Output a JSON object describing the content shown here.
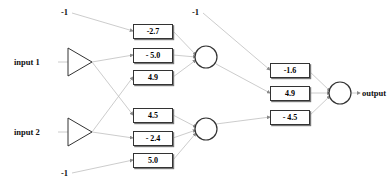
{
  "diagram": {
    "background_color": "#ffffff",
    "line_color": "#b0b0b0",
    "stroke_color": "#333333",
    "inputs": [
      {
        "label": "input 1",
        "icon": "triangle-buffer-icon"
      },
      {
        "label": "input 2",
        "icon": "triangle-buffer-icon"
      }
    ],
    "biases": [
      {
        "id": "bias-hidden-1",
        "label": "-1"
      },
      {
        "id": "bias-hidden-2",
        "label": "-1"
      },
      {
        "id": "bias-output",
        "label": "-1"
      }
    ],
    "weights_layer1": [
      {
        "id": "w-bias1-h1",
        "label": "-2.7",
        "value": -2.7
      },
      {
        "id": "w-in1-h1",
        "label": "- 5.0",
        "value": -5.0
      },
      {
        "id": "w-in2-h1",
        "label": "4.9",
        "value": 4.9
      },
      {
        "id": "w-in1-h2",
        "label": "4.5",
        "value": 4.5
      },
      {
        "id": "w-in2-h2",
        "label": "- 2.4",
        "value": -2.4
      },
      {
        "id": "w-bias2-h2",
        "label": "5.0",
        "value": 5.0
      }
    ],
    "weights_layer2": [
      {
        "id": "w-bias3-out",
        "label": "-1.6",
        "value": -1.6
      },
      {
        "id": "w-h1-out",
        "label": "4.9",
        "value": 4.9
      },
      {
        "id": "w-h2-out",
        "label": "- 4.5",
        "value": -4.5
      }
    ],
    "hidden_nodes": [
      {
        "id": "hidden-neuron-1",
        "label": ""
      },
      {
        "id": "hidden-neuron-2",
        "label": ""
      }
    ],
    "output_node": {
      "id": "output-neuron",
      "label": ""
    },
    "output": {
      "label": "output"
    }
  }
}
